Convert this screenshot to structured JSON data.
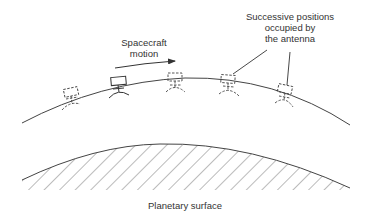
{
  "diagram": {
    "type": "spacecraft synthetic aperture illustration",
    "labels": {
      "motion_line1": "Spacecraft",
      "motion_line2": "motion",
      "positions_line1": "Successive positions",
      "positions_line2": "occupied by",
      "positions_line3": "the antenna",
      "surface": "Planetary surface"
    },
    "elements": {
      "orbit_path": "curved line representing spacecraft orbit",
      "motion_arrow": "arrow pointing right indicating direction",
      "antenna_positions": [
        {
          "index": 1,
          "style": "dashed",
          "x": 70,
          "y": 93
        },
        {
          "index": 2,
          "style": "solid",
          "x": 118,
          "y": 81
        },
        {
          "index": 3,
          "style": "dashed",
          "x": 175,
          "y": 77
        },
        {
          "index": 4,
          "style": "dashed",
          "x": 228,
          "y": 80
        },
        {
          "index": 5,
          "style": "dashed",
          "x": 285,
          "y": 90
        }
      ],
      "leader_lines": 2,
      "surface": "hatched planetary surface arc"
    },
    "colors": {
      "line": "#333333",
      "text": "#333333",
      "background": "#ffffff"
    }
  }
}
